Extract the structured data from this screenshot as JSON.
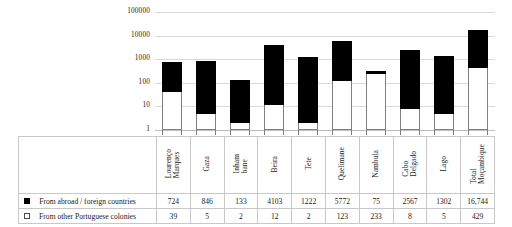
{
  "chart_data": {
    "type": "bar",
    "title": "",
    "subtitle": "",
    "xlabel": "",
    "ylabel": "",
    "stacked": true,
    "yscale": "log",
    "ylim": [
      1,
      100000
    ],
    "ytick_labels": [
      "100000",
      "10000",
      "1000",
      "100",
      "10",
      "1"
    ],
    "ytick_values": [
      100000,
      10000,
      1000,
      100,
      10,
      1
    ],
    "grid": true,
    "legend_position": "table-left",
    "categories": [
      "Lourenço\nMarques",
      "Gaza",
      "Inham\nbane",
      "Beira",
      "Tete",
      "Quelimane",
      "Nambula",
      "Cabo\nDelgado",
      "Lago",
      "Total\nMoçambique"
    ],
    "series": [
      {
        "name": "From abroad / foreign countries",
        "marker": "filled-square",
        "color": "#000000",
        "values": [
          724,
          846,
          133,
          4103,
          1222,
          5772,
          75,
          2567,
          1302,
          16744
        ],
        "value_labels": [
          "724",
          "846",
          "133",
          "4103",
          "1222",
          "5772",
          "75",
          "2567",
          "1302",
          "16,744"
        ]
      },
      {
        "name": "From other Portuguese colonies",
        "marker": "open-square",
        "color": "#ffffff",
        "values": [
          39,
          5,
          2,
          12,
          2,
          123,
          233,
          8,
          5,
          429
        ],
        "value_labels": [
          "39",
          "5",
          "2",
          "12",
          "2",
          "123",
          "233",
          "8",
          "5",
          "429"
        ]
      }
    ]
  },
  "colors": {
    "foreign": "#000000",
    "colonies": "#ffffff",
    "grid": "#d9d9d9",
    "border": "#c8c8c8",
    "text": "#1a1a1a"
  }
}
